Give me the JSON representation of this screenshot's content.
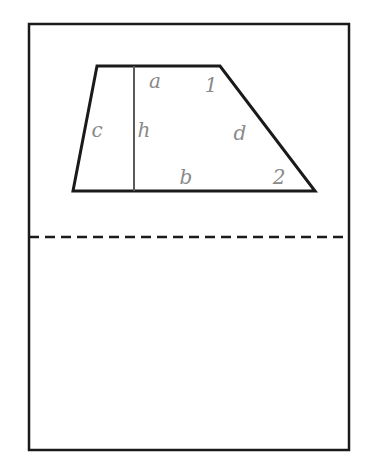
{
  "figure": {
    "type": "geometry-diagram",
    "shape_name": "trapezoid",
    "background_color": "#ffffff",
    "stroke_color": "#1a1a1a",
    "label_color": "#8a8a8a",
    "frame": {
      "name": "page-border",
      "x": 29,
      "y": 24,
      "width": 320,
      "height": 426,
      "stroke_width": 2.5
    },
    "dashed_line": {
      "name": "fold-line",
      "y": 237,
      "x_start": 29,
      "x_end": 349,
      "dash": "10 6",
      "stroke_width": 2.5
    },
    "trapezoid": {
      "stroke_width": 3,
      "vertices": [
        {
          "name": "top-left",
          "x": 97,
          "y": 66
        },
        {
          "name": "top-right",
          "x": 220,
          "y": 66
        },
        {
          "name": "bottom-right",
          "x": 315,
          "y": 191
        },
        {
          "name": "bottom-left",
          "x": 73,
          "y": 191
        }
      ]
    },
    "height_segment": {
      "name": "height-line",
      "x": 134,
      "y_top": 66,
      "y_bottom": 191,
      "stroke_width": 2
    },
    "labels": [
      {
        "id": "a",
        "text": "a",
        "x": 155,
        "y": 82,
        "meaning": "top-side"
      },
      {
        "id": "one",
        "text": "1",
        "x": 211,
        "y": 86,
        "meaning": "angle-one"
      },
      {
        "id": "c",
        "text": "c",
        "x": 97,
        "y": 131,
        "meaning": "left-side"
      },
      {
        "id": "h",
        "text": "h",
        "x": 144,
        "y": 131,
        "meaning": "height"
      },
      {
        "id": "d",
        "text": "d",
        "x": 240,
        "y": 134,
        "meaning": "right-side"
      },
      {
        "id": "b",
        "text": "b",
        "x": 186,
        "y": 178,
        "meaning": "bottom-side"
      },
      {
        "id": "two",
        "text": "2",
        "x": 279,
        "y": 178,
        "meaning": "angle-two"
      }
    ]
  }
}
